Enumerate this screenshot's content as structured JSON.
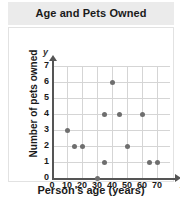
{
  "chart_data": {
    "type": "scatter",
    "title": "Age and Pets Owned",
    "xlabel": "Person's age (years)",
    "ylabel": "Number of pets owned",
    "x_axis_variable": "x",
    "y_axis_variable": "y",
    "xlim": [
      0,
      70
    ],
    "ylim": [
      0,
      7
    ],
    "xticks": [
      0,
      10,
      20,
      30,
      40,
      50,
      60,
      70
    ],
    "yticks": [
      0,
      1,
      2,
      3,
      4,
      5,
      6,
      7
    ],
    "grid": true,
    "legend": null,
    "point_color": "#6e6e6e",
    "title_band_color": "#ebebeb",
    "points": [
      {
        "x": 10,
        "y": 3
      },
      {
        "x": 15,
        "y": 2
      },
      {
        "x": 20,
        "y": 2
      },
      {
        "x": 30,
        "y": 0
      },
      {
        "x": 35,
        "y": 1
      },
      {
        "x": 35,
        "y": 4
      },
      {
        "x": 40,
        "y": 6
      },
      {
        "x": 45,
        "y": 4
      },
      {
        "x": 50,
        "y": 2
      },
      {
        "x": 60,
        "y": 4
      },
      {
        "x": 65,
        "y": 1
      },
      {
        "x": 70,
        "y": 1
      }
    ]
  }
}
